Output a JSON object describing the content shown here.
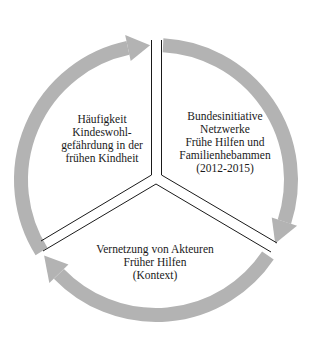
{
  "diagram": {
    "type": "cycle",
    "arc_color": "#b3b3b3",
    "divider_color": "#1a1a1a",
    "segments": [
      {
        "id": "left",
        "lines": [
          "Häufigkeit",
          "Kindeswohl-",
          "gefährdung in der",
          "frühen Kindheit"
        ]
      },
      {
        "id": "right",
        "lines": [
          "Bundesinitiative",
          "Netzwerke",
          "Frühe Hilfen und",
          "Familienhebammen",
          "(2012-2015)"
        ]
      },
      {
        "id": "bottom",
        "lines": [
          "Vernetzung von Akteuren",
          "Früher Hilfen",
          "(Kontext)"
        ]
      }
    ]
  }
}
